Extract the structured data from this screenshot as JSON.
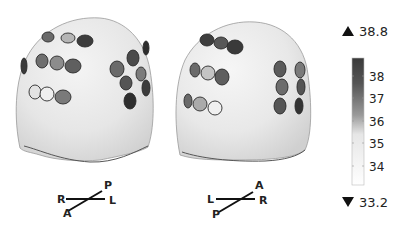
{
  "figure": {
    "type": "topographic-head-temperature-map",
    "background": "#ffffff"
  },
  "heads": [
    {
      "id": "left-view",
      "orientation": {
        "top": "P",
        "left": "R",
        "right": "L",
        "bottom": "A"
      },
      "electrodes": [
        {
          "cx": 48,
          "cy": 37,
          "rx": 6,
          "ry": 5,
          "color": "#6a6a6a"
        },
        {
          "cx": 68,
          "cy": 38,
          "rx": 7,
          "ry": 5,
          "color": "#b5b5b5"
        },
        {
          "cx": 85,
          "cy": 41,
          "rx": 8,
          "ry": 6,
          "color": "#3c3c3c"
        },
        {
          "cx": 42,
          "cy": 61,
          "rx": 6,
          "ry": 7,
          "color": "#6f6f6f"
        },
        {
          "cx": 57,
          "cy": 63,
          "rx": 7,
          "ry": 7,
          "color": "#8c8c8c"
        },
        {
          "cx": 73,
          "cy": 66,
          "rx": 8,
          "ry": 7,
          "color": "#5f5f5f"
        },
        {
          "cx": 35,
          "cy": 92,
          "rx": 6,
          "ry": 7,
          "color": "#e2e2e2"
        },
        {
          "cx": 47,
          "cy": 94,
          "rx": 7,
          "ry": 7,
          "color": "#efefef"
        },
        {
          "cx": 63,
          "cy": 97,
          "rx": 8,
          "ry": 7,
          "color": "#7a7a7a"
        },
        {
          "cx": 24,
          "cy": 66,
          "rx": 3,
          "ry": 8,
          "color": "#3a3a3a"
        },
        {
          "cx": 117,
          "cy": 69,
          "rx": 7,
          "ry": 8,
          "color": "#6a6a6a"
        },
        {
          "cx": 133,
          "cy": 58,
          "rx": 6,
          "ry": 8,
          "color": "#4a4a4a"
        },
        {
          "cx": 141,
          "cy": 74,
          "rx": 5,
          "ry": 7,
          "color": "#7b7b7b"
        },
        {
          "cx": 126,
          "cy": 83,
          "rx": 6,
          "ry": 7,
          "color": "#555555"
        },
        {
          "cx": 146,
          "cy": 88,
          "rx": 4,
          "ry": 8,
          "color": "#3c3c3c"
        },
        {
          "cx": 130,
          "cy": 101,
          "rx": 6,
          "ry": 8,
          "color": "#2e2e2e"
        },
        {
          "cx": 146,
          "cy": 48,
          "rx": 3,
          "ry": 7,
          "color": "#2e2e2e"
        }
      ]
    },
    {
      "id": "right-view",
      "orientation": {
        "top": "A",
        "left": "L",
        "right": "R",
        "bottom": "P"
      },
      "electrodes": [
        {
          "cx": 207,
          "cy": 40,
          "rx": 7,
          "ry": 6,
          "color": "#3e3e3e"
        },
        {
          "cx": 221,
          "cy": 43,
          "rx": 7,
          "ry": 6,
          "color": "#585858"
        },
        {
          "cx": 235,
          "cy": 47,
          "rx": 8,
          "ry": 7,
          "color": "#3a3a3a"
        },
        {
          "cx": 195,
          "cy": 70,
          "rx": 5,
          "ry": 7,
          "color": "#6a6a6a"
        },
        {
          "cx": 208,
          "cy": 73,
          "rx": 7,
          "ry": 7,
          "color": "#c4c4c4"
        },
        {
          "cx": 222,
          "cy": 77,
          "rx": 7,
          "ry": 8,
          "color": "#5e5e5e"
        },
        {
          "cx": 188,
          "cy": 101,
          "rx": 4,
          "ry": 7,
          "color": "#6a6a6a"
        },
        {
          "cx": 200,
          "cy": 104,
          "rx": 7,
          "ry": 7,
          "color": "#aaaaaa"
        },
        {
          "cx": 215,
          "cy": 108,
          "rx": 7,
          "ry": 7,
          "color": "#f0f0f0"
        },
        {
          "cx": 280,
          "cy": 69,
          "rx": 6,
          "ry": 8,
          "color": "#5b5b5b"
        },
        {
          "cx": 282,
          "cy": 87,
          "rx": 6,
          "ry": 8,
          "color": "#6c6c6c"
        },
        {
          "cx": 280,
          "cy": 106,
          "rx": 6,
          "ry": 8,
          "color": "#555555"
        },
        {
          "cx": 300,
          "cy": 70,
          "rx": 5,
          "ry": 8,
          "color": "#7a7a7a"
        },
        {
          "cx": 301,
          "cy": 87,
          "rx": 4,
          "ry": 8,
          "color": "#555555"
        },
        {
          "cx": 299,
          "cy": 106,
          "rx": 4,
          "ry": 8,
          "color": "#333333"
        }
      ]
    }
  ],
  "colorbar": {
    "max_label": "38.8",
    "min_label": "33.2",
    "ticks": [
      "38",
      "37",
      "36",
      "35",
      "34"
    ],
    "range": [
      33.2,
      38.8
    ],
    "colormap": "gray (white = low, black = high)",
    "top_color": "#3a3a3a",
    "bottom_color": "#ffffff",
    "units": "°C"
  }
}
